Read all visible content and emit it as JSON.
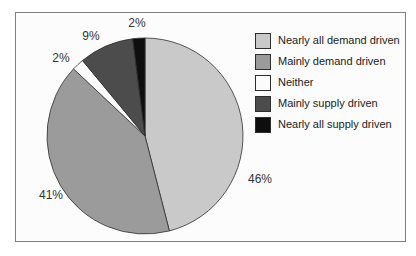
{
  "figure": {
    "frame_background": "#fcfcfc",
    "frame_border_color": "#7f7f7f",
    "slice_outline_color": "#2e2e2e",
    "label_text_color": "#333333"
  },
  "chart_data": {
    "type": "pie",
    "title": "",
    "categories": [
      "Nearly all demand driven",
      "Mainly demand driven",
      "Neither",
      "Mainly supply driven",
      "Nearly all supply driven"
    ],
    "values": [
      46,
      41,
      2,
      9,
      2
    ],
    "unit": "%",
    "data_labels": [
      "46%",
      "41%",
      "2%",
      "9%",
      "2%"
    ],
    "colors": [
      "#c9c9c9",
      "#9b9b9b",
      "#fbfbfb",
      "#4c4c4c",
      "#0e0e0e"
    ],
    "start_angle_deg": 0,
    "direction": "clockwise",
    "legend_position": "right",
    "layout": {
      "center_x": 145,
      "center_y": 136,
      "radius": 98,
      "label_positions": [
        [
          260,
          180
        ],
        [
          51,
          196
        ],
        [
          61,
          59
        ],
        [
          91,
          37
        ],
        [
          137,
          24
        ]
      ]
    }
  }
}
